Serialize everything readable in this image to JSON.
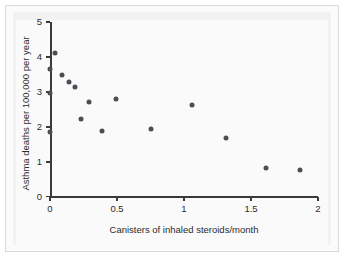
{
  "chart_data": {
    "type": "scatter",
    "title": "",
    "xlabel": "Canisters of inhaled steroids/month",
    "ylabel": "Asthma deaths per 100,000 per year",
    "xlim": [
      0,
      2
    ],
    "ylim": [
      0,
      5
    ],
    "grid": false,
    "legend": null,
    "xticks": [
      "0",
      "0.5",
      "1",
      "1.5",
      "2"
    ],
    "xtick_values": [
      0,
      0.5,
      1,
      1.5,
      2
    ],
    "yticks": [
      "0",
      "1",
      "2",
      "3",
      "4",
      "5"
    ],
    "ytick_values": [
      0,
      1,
      2,
      3,
      4,
      5
    ],
    "marker": "filled-circle",
    "marker_color": "#4d4d55",
    "points": [
      {
        "x": 0.0,
        "y": 3.66
      },
      {
        "x": 0.0,
        "y": 2.97
      },
      {
        "x": 0.0,
        "y": 1.84
      },
      {
        "x": 0.04,
        "y": 4.12
      },
      {
        "x": 0.09,
        "y": 3.48
      },
      {
        "x": 0.145,
        "y": 3.28
      },
      {
        "x": 0.185,
        "y": 3.15
      },
      {
        "x": 0.235,
        "y": 2.23
      },
      {
        "x": 0.29,
        "y": 2.71
      },
      {
        "x": 0.385,
        "y": 1.89
      },
      {
        "x": 0.49,
        "y": 2.8
      },
      {
        "x": 0.755,
        "y": 1.94
      },
      {
        "x": 1.06,
        "y": 2.64
      },
      {
        "x": 1.315,
        "y": 1.67
      },
      {
        "x": 1.61,
        "y": 0.81
      },
      {
        "x": 1.865,
        "y": 0.78
      }
    ]
  },
  "figure": {
    "background_color": "#fbfbfb",
    "panel_color": "#f2f2f2",
    "axis_color": "#3a3a3a"
  }
}
